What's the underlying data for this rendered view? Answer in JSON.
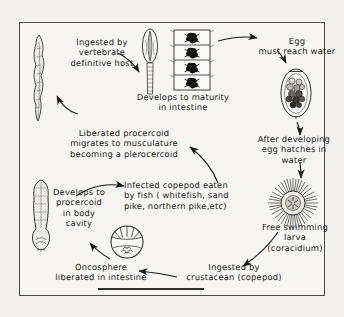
{
  "figure": {
    "style": {
      "ink": "#1b1b1b",
      "paper": "#f7f6f3",
      "page_background": "#f3f1ee",
      "border": "#4a4a48"
    }
  },
  "captions": {
    "ingested_by_host": "Ingested by\nvertebrate\ndefinitive host",
    "develops_maturity": "Develops to maturity\nin  intestine",
    "egg_reach_water": "Egg\nmust reach water",
    "after_developing": "After developing\negg hatches in\nwater",
    "liberated_procercoid": "Liberated  procercoid\nmigrates  to musculature\nbecoming  a plerocercoid",
    "infected_copepod": "Infected copepod  eaten\nby fish ( whitefish, sand\npike, northern pike,etc)",
    "develops_procercoid": "Develops to\nprocercoid\nin body\ncavity",
    "free_swimming_larva": "Free swimming\nlarva\n(coracidium)",
    "oncosphere": "Oncosphere\nliberated in intestine",
    "ingested_crustacean": "Ingested by\ncrustacean (copepod)"
  },
  "illustrations": {
    "adult_worm": "adult-tapeworm-illustration",
    "scolex": "scolex-illustration",
    "proglottids": "gravid-proglottid-chain-illustration",
    "egg": "operculate-egg-illustration",
    "coracidium": "ciliated-coracidium-illustration",
    "oncosphere": "hexacanth-oncosphere-illustration",
    "plerocercoid": "plerocercoid-larva-illustration"
  },
  "arrows": {
    "host_to_adult": "arrow-to-adult-worm",
    "adult_to_scolex": "arrow-to-scolex",
    "proglottid_to_egg": "arrow-to-egg",
    "egg_to_hatching": "arrow-egg-hatching",
    "hatching_to_coracidium": "arrow-to-coracidium",
    "coracidium_to_crustacean": "arrow-to-crustacean",
    "crustacean_to_oncosphere": "arrow-to-oncosphere",
    "oncosphere_to_procercoid": "arrow-to-procercoid",
    "procercoid_to_copepod": "arrow-to-infected-copepod",
    "copepod_to_plerocercoid": "arrow-to-plerocercoid",
    "plerocercoid_to_host": "arrow-to-definitive-host"
  }
}
